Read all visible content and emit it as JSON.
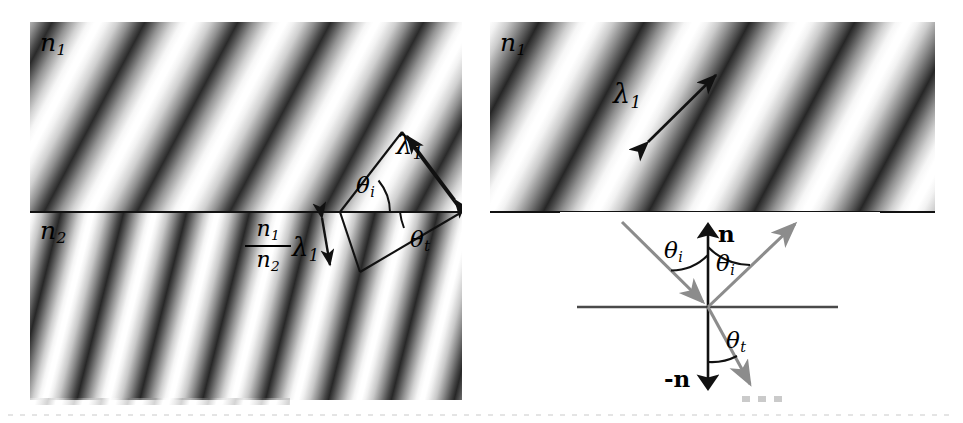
{
  "figure": {
    "type": "physics-diagram",
    "panels": [
      {
        "id": "left-panel",
        "name": "wavefront-refraction-panel",
        "regions": [
          {
            "name": "incident-medium",
            "label": "n",
            "subscript": "1"
          },
          {
            "name": "transmitted-medium",
            "label": "n",
            "subscript": "2"
          }
        ],
        "annotations": [
          {
            "name": "incident-wavelength",
            "label": "λ",
            "subscript": "1"
          },
          {
            "name": "transmitted-wavelength",
            "numerator": "n₁",
            "denominator": "n₂",
            "label": "λ",
            "subscript": "1"
          },
          {
            "name": "angle-of-incidence",
            "label": "θ",
            "subscript": "i"
          },
          {
            "name": "angle-of-transmission",
            "label": "θ",
            "subscript": "t"
          }
        ]
      },
      {
        "id": "right-top-panel",
        "name": "plane-wave-panel",
        "regions": [
          {
            "name": "incident-medium",
            "label": "n",
            "subscript": "1"
          }
        ],
        "annotations": [
          {
            "name": "wavelength",
            "label": "λ",
            "subscript": "1"
          }
        ]
      },
      {
        "id": "right-bottom-panel",
        "name": "ray-diagram-panel",
        "annotations": [
          {
            "name": "surface-normal",
            "label": "n"
          },
          {
            "name": "negative-surface-normal",
            "label": "-n"
          },
          {
            "name": "angle-of-incidence",
            "label": "θ",
            "subscript": "i"
          },
          {
            "name": "angle-of-reflection",
            "label": "θ",
            "subscript": "i"
          },
          {
            "name": "angle-of-transmission",
            "label": "θ",
            "subscript": "t"
          }
        ],
        "rays": [
          {
            "name": "incident-ray",
            "color": "#8c8c8c"
          },
          {
            "name": "reflected-ray",
            "color": "#8c8c8c"
          },
          {
            "name": "transmitted-ray",
            "color": "#8c8c8c"
          }
        ]
      }
    ],
    "labels": {
      "n1": "n",
      "n1_sub": "1",
      "n2": "n",
      "n2_sub": "2",
      "lambda": "λ",
      "lambda_sub": "1",
      "theta": "θ",
      "theta_i_sub": "i",
      "theta_t_sub": "t",
      "normal": "n",
      "normal_neg": "-n"
    },
    "colors": {
      "ink": "#111111",
      "ray": "#8c8c8c",
      "background": "#ffffff"
    }
  }
}
